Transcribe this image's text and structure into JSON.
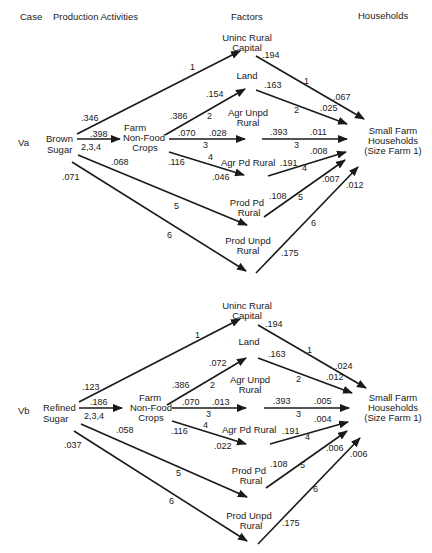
{
  "headers": {
    "case": "Case",
    "production": "Production Activities",
    "factors": "Factors",
    "households": "Households"
  },
  "colors": {
    "ink": "#1a1a1a",
    "background": "#ffffff"
  },
  "panels": [
    {
      "case": "Va",
      "source": [
        "Brown",
        "Sugar"
      ],
      "intermediate": [
        "Farm",
        "Non-Food",
        "Crops"
      ],
      "factors": {
        "unincRural": [
          "Uninc Rural",
          "Capital"
        ],
        "land": "Land",
        "agrUnpd": [
          "Agr Unpd",
          "Rural"
        ],
        "agrPd": "Agr Pd Rural",
        "prodPd": [
          "Prod Pd",
          "Rural"
        ],
        "prodUnpd": [
          "Prod Unpd",
          "Rural"
        ]
      },
      "household": [
        "Small Farm",
        "Households",
        "(Size Farm 1)"
      ],
      "edges": {
        "src_to_uninc": {
          "coef": ".346",
          "path": "1"
        },
        "src_to_farm": {
          "coef": ".398",
          "path": "2,3,4"
        },
        "src_to_prodpd": {
          "coef": ".068",
          "path": "5"
        },
        "src_to_produnpd": {
          "coef": ".071",
          "path": "6"
        },
        "farm_to_land": {
          "coef_a": ".386",
          "coef_b": ".154",
          "path": "2"
        },
        "farm_to_agrunpd": {
          "coef_a": ".070",
          "coef_b": ".028",
          "path": "3"
        },
        "farm_to_agrpd": {
          "coef_a": ".116",
          "coef_b": ".046",
          "path": "4"
        },
        "uninc_to_hh": {
          "coef_a": ".194",
          "coef_b": ".067",
          "path": "1"
        },
        "land_to_hh": {
          "coef_a": ".163",
          "coef_b": ".025",
          "path": "2"
        },
        "agrunpd_to_hh": {
          "coef_a": ".393",
          "coef_b": ".011",
          "path": "3"
        },
        "agrpd_to_hh": {
          "coef_a": ".191",
          "coef_b": ".008",
          "path": "4"
        },
        "prodpd_to_hh": {
          "coef_a": ".108",
          "coef_b": ".007",
          "path": "5"
        },
        "produnpd_to_hh": {
          "coef_a": ".175",
          "coef_b": ".012",
          "path": "6"
        }
      }
    },
    {
      "case": "Vb",
      "source": [
        "Refined",
        "Sugar"
      ],
      "intermediate": [
        "Farm",
        "Non-Food",
        "Crops"
      ],
      "factors": {
        "unincRural": [
          "Uninc Rural",
          "Capital"
        ],
        "land": "Land",
        "agrUnpd": [
          "Agr Unpd",
          "Rural"
        ],
        "agrPd": "Agr Pd Rural",
        "prodPd": [
          "Prod Pd",
          "Rural"
        ],
        "prodUnpd": [
          "Prod Unpd",
          "Rural"
        ]
      },
      "household": [
        "Small Farm",
        "Households",
        "(Size Farm 1)"
      ],
      "edges": {
        "src_to_uninc": {
          "coef": ".123",
          "path": "1"
        },
        "src_to_farm": {
          "coef": ".186",
          "path": "2,3,4"
        },
        "src_to_prodpd": {
          "coef": ".058",
          "path": "5"
        },
        "src_to_produnpd": {
          "coef": ".037",
          "path": "6"
        },
        "farm_to_land": {
          "coef_a": ".386",
          "coef_b": ".072",
          "path": "2"
        },
        "farm_to_agrunpd": {
          "coef_a": ".070",
          "coef_b": ".013",
          "path": "3"
        },
        "farm_to_agrpd": {
          "coef_a": ".116",
          "coef_b": ".022",
          "path": "4"
        },
        "uninc_to_hh": {
          "coef_a": ".194",
          "coef_b": ".024",
          "path": "1"
        },
        "land_to_hh": {
          "coef_a": ".163",
          "coef_b": ".012",
          "path": "2"
        },
        "agrunpd_to_hh": {
          "coef_a": ".393",
          "coef_b": ".005",
          "path": "3"
        },
        "agrpd_to_hh": {
          "coef_a": ".191",
          "coef_b": ".004",
          "path": "4"
        },
        "prodpd_to_hh": {
          "coef_a": ".108",
          "coef_b": ".006",
          "path": "5"
        },
        "produnpd_to_hh": {
          "coef_a": ".175",
          "coef_b": ".006",
          "path": "6"
        }
      }
    }
  ]
}
